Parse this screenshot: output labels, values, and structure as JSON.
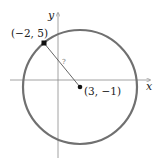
{
  "diagram": {
    "axes": {
      "x_label": "x",
      "y_label": "y"
    },
    "circle": {
      "center": {
        "label": "(3, −1)",
        "x": 3,
        "y": -1
      },
      "point_on_circle": {
        "label": "(−2, 5)",
        "x": -2,
        "y": 5
      },
      "radius_label": "?"
    },
    "colors": {
      "circle": "#707070",
      "axes": "#8a8a8a",
      "radius_line": "#555555",
      "points": "#111111"
    }
  }
}
